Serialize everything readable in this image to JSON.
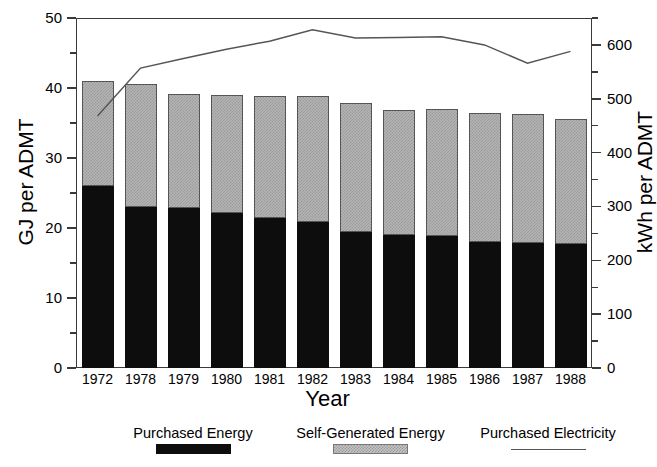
{
  "chart_data": {
    "type": "bar",
    "title": "",
    "subtitle": "",
    "xlabel": "Year",
    "ylabel": "GJ per ADMT",
    "ylabel_secondary": "kWh per ADMT",
    "categories": [
      "1972",
      "1978",
      "1979",
      "1980",
      "1981",
      "1982",
      "1983",
      "1984",
      "1985",
      "1986",
      "1987",
      "1988"
    ],
    "ylim": [
      0,
      50
    ],
    "ylim_secondary": [
      0,
      650
    ],
    "ytick_labels": [
      "0",
      "10",
      "20",
      "30",
      "40",
      "50"
    ],
    "ytick_values": [
      0,
      10,
      20,
      30,
      40,
      50
    ],
    "ytick_minor_values": [
      5,
      15,
      25,
      35,
      45
    ],
    "ytick_labels_secondary": [
      "0",
      "100",
      "200",
      "300",
      "400",
      "500",
      "600"
    ],
    "ytick_values_secondary": [
      0,
      100,
      200,
      300,
      400,
      500,
      600
    ],
    "ytick_minor_values_secondary": [
      50,
      150,
      250,
      350,
      450,
      550,
      650
    ],
    "grid": false,
    "legend_position": "bottom",
    "stacked": true,
    "series": [
      {
        "name": "Purchased Energy",
        "kind": "bar-segment",
        "axis": "left",
        "color": "#0d0d0d",
        "values": [
          26.0,
          23.0,
          22.9,
          22.2,
          21.4,
          20.9,
          19.5,
          19.0,
          18.8,
          18.0,
          17.9,
          17.7
        ]
      },
      {
        "name": "Self-Generated Energy",
        "kind": "bar-segment",
        "axis": "left",
        "color": "#b4b4b4",
        "values": [
          15.0,
          17.6,
          16.3,
          16.8,
          17.4,
          18.0,
          18.3,
          17.9,
          18.2,
          18.4,
          18.4,
          17.9
        ]
      },
      {
        "name": "Purchased Electricity",
        "kind": "line",
        "axis": "right",
        "color": "#555555",
        "values": [
          468,
          557,
          575,
          592,
          607,
          628,
          613,
          614,
          615,
          600,
          566,
          588
        ]
      }
    ],
    "totals": [
      41.0,
      40.6,
      39.2,
      39.0,
      38.8,
      38.9,
      37.8,
      36.9,
      37.0,
      36.4,
      36.3,
      35.6
    ]
  },
  "legend": {
    "items": [
      {
        "label": "Purchased Energy",
        "swatch": "black-fill"
      },
      {
        "label": "Self-Generated Energy",
        "swatch": "gray-hatched-fill"
      },
      {
        "label": "Purchased Electricity",
        "swatch": "line"
      }
    ]
  }
}
